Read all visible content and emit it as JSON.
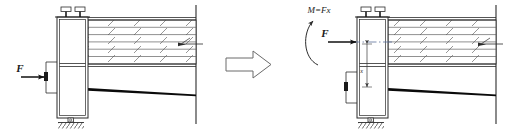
{
  "figure": {
    "background_color": "#ffffff",
    "line_color": "#2b2b2b",
    "heavy_line_color": "#000000",
    "hatch_color": "#555555",
    "width": 511,
    "height": 134
  },
  "transform_arrow": {
    "name": "equals-transform-arrow",
    "direction": "right"
  },
  "left_diagram": {
    "name": "original-loading-case",
    "force": {
      "label": "F",
      "direction": "right",
      "application": "eccentric-left-bracket"
    },
    "body": {
      "name": "vertical-column",
      "parts": [
        "upper-section",
        "lower-section"
      ]
    },
    "fasteners": {
      "count": 2,
      "name": "top-bolt"
    },
    "support": {
      "name": "pin-support-ground",
      "type": "pinned"
    },
    "beam_stack": {
      "name": "laminated-beam-stack",
      "layer_count": 6,
      "hatched": true
    },
    "deflected_member": {
      "name": "deflected-beam-line"
    },
    "wall": {
      "name": "fixed-wall-line"
    }
  },
  "right_diagram": {
    "name": "equivalent-loading-case",
    "moment": {
      "label": "M=Fx",
      "sense": "counterclockwise"
    },
    "force": {
      "label": "F",
      "direction": "right",
      "application": "centroidal-axis"
    },
    "dimension": {
      "label": "x",
      "name": "eccentricity-dimension"
    },
    "body": {
      "name": "vertical-column",
      "parts": [
        "upper-section",
        "lower-section"
      ]
    },
    "fasteners": {
      "count": 2,
      "name": "top-bolt"
    },
    "support": {
      "name": "pin-support-ground",
      "type": "pinned"
    },
    "beam_stack": {
      "name": "laminated-beam-stack",
      "layer_count": 6,
      "hatched": true
    },
    "deflected_member": {
      "name": "deflected-beam-line"
    },
    "wall": {
      "name": "fixed-wall-line"
    }
  }
}
